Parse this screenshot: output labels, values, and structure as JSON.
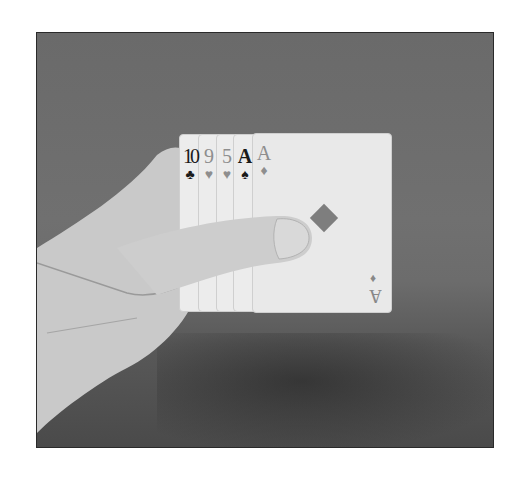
{
  "image": {
    "description": "Grayscale photograph of a hand holding a fan of five playing cards against a gray backdrop",
    "cards": [
      {
        "rank": "10",
        "suit": "♣",
        "suit_name": "clubs",
        "color": "black"
      },
      {
        "rank": "9",
        "suit": "♥",
        "suit_name": "hearts",
        "color": "red"
      },
      {
        "rank": "5",
        "suit": "♥",
        "suit_name": "hearts",
        "color": "red"
      },
      {
        "rank": "A",
        "suit": "♠",
        "suit_name": "spades",
        "color": "black"
      },
      {
        "rank": "A",
        "suit": "♦",
        "suit_name": "diamonds",
        "color": "red"
      }
    ],
    "front_card": {
      "rank": "A",
      "suit": "♦",
      "center_pip": "♦"
    }
  }
}
